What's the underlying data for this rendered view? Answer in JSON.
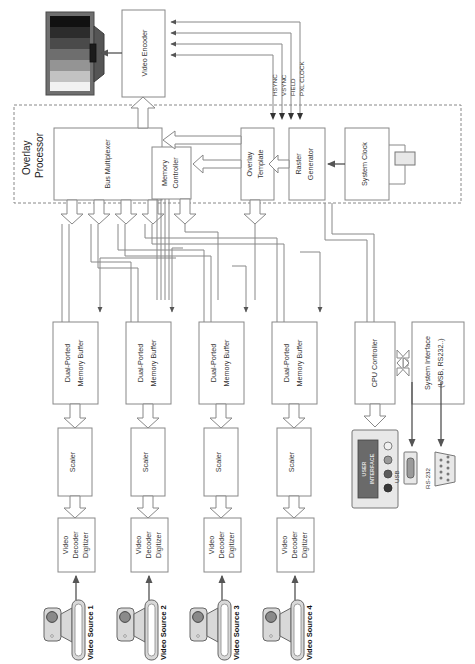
{
  "diagram": {
    "groups": [
      {
        "id": "overlay_processor",
        "label_line1": "Overlay",
        "label_line2": "Processor"
      }
    ],
    "blocks": {
      "video_encoder": "Video Encoder",
      "bus_multiplexer": "Bus Multiplexer",
      "memory_controller_l1": "Memory",
      "memory_controller_l2": "Controller",
      "overlay_template_l1": "Overlay",
      "overlay_template_l2": "Template",
      "raster_generator_l1": "Raster",
      "raster_generator_l2": "Generator",
      "system_clock": "System Clock",
      "cpu_controller": "CPU Controller",
      "system_interface_l1": "System Interface",
      "system_interface_l2": "(USB, RS232..)",
      "dual_ported_memory_buffer_l1": "Dual-Ported",
      "dual_ported_memory_buffer_l2": "Memory Buffer",
      "scaler": "Scaler",
      "video_decoder_l1": "Video",
      "video_decoder_l2": "Decoder",
      "video_decoder_l3": "Digitizer"
    },
    "signals": [
      {
        "name": "HSYNC"
      },
      {
        "name": "VSYNC"
      },
      {
        "name": "FIELD"
      },
      {
        "name": "PXL CLOCK"
      }
    ],
    "connectors": {
      "usb": "USB",
      "rs232": "RS-232"
    },
    "user_interface_l1": "USER",
    "user_interface_l2": "INTERFACE",
    "channels": [
      {
        "source_label": "Video Source 1"
      },
      {
        "source_label": "Video Source 2"
      },
      {
        "source_label": "Video Source 3"
      },
      {
        "source_label": "Video Source 4"
      }
    ],
    "monitor": {
      "bars": [
        "#111111",
        "#2c2c2c",
        "#4a4a4a",
        "#6e6e6e",
        "#949494",
        "#c2c2c2",
        "#f2f2f2"
      ]
    },
    "colors": {
      "line": "#888888",
      "text": "#333333",
      "block_fill": "#ffffff",
      "device_fill": "#e8e8e8"
    }
  }
}
